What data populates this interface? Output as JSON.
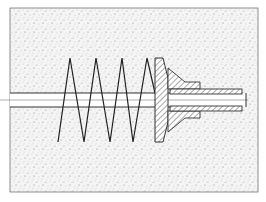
{
  "diagram": {
    "title": "",
    "colors": {
      "background": "#ffffff",
      "matrix_fill": "#f2f2f2",
      "stipple": "#8a8a8a",
      "line": "#333333",
      "hatch": "#555555"
    },
    "components": [
      {
        "id": "matrix",
        "label": "embedding material (stippled)"
      },
      {
        "id": "rod",
        "label": "central rod"
      },
      {
        "id": "helix",
        "label": "helical spiral, 4 turns"
      },
      {
        "id": "flange",
        "label": "hatched flange / washer plate"
      },
      {
        "id": "sleeve",
        "label": "hatched sleeve"
      }
    ],
    "helix_turns": 4
  }
}
